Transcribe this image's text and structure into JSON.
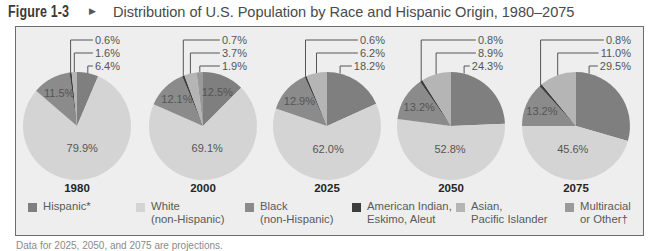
{
  "figure": {
    "number": "Figure 1-3",
    "arrow_icon": "▶",
    "title": "Distribution of U.S. Population by Race and Hispanic Origin, 1980–2075"
  },
  "legend": [
    {
      "key": "hispanic",
      "line1": "Hispanic*",
      "line2": "",
      "color": "#7f7f7f"
    },
    {
      "key": "white",
      "line1": "White",
      "line2": "(non-Hispanic)",
      "color": "#d4d4d4"
    },
    {
      "key": "black",
      "line1": "Black",
      "line2": "(non-Hispanic)",
      "color": "#8b8b8b"
    },
    {
      "key": "american_indian",
      "line1": "American Indian,",
      "line2": "Eskimo, Aleut",
      "color": "#3d3d3d"
    },
    {
      "key": "asian",
      "line1": "Asian,",
      "line2": "Pacific Islander",
      "color": "#b5b5b5"
    },
    {
      "key": "multiracial",
      "line1": "Multiracial",
      "line2": "or Other†",
      "color": "#9a9a9a"
    }
  ],
  "footnote": "Data for 2025, 2050, and 2075 are projections.",
  "chart_data": {
    "type": "pie",
    "title": "Distribution of U.S. Population by Race and Hispanic Origin, 1980–2075",
    "unit": "%",
    "categories": [
      "Hispanic*",
      "White (non-Hispanic)",
      "Black (non-Hispanic)",
      "American Indian, Eskimo, Aleut",
      "Asian, Pacific Islander",
      "Multiracial or Other†"
    ],
    "legend_position": "bottom",
    "layout": {
      "cy": 126,
      "r": 54,
      "label_rows_y": [
        40,
        53,
        66
      ]
    },
    "pies": [
      {
        "year": "1980",
        "cx": 77,
        "label_right_x": 120,
        "slices": [
          {
            "key": "hispanic",
            "value": 6.4,
            "label": "6.4%",
            "placement": "outside",
            "row": 2
          },
          {
            "key": "white",
            "value": 79.9,
            "label": "79.9%",
            "placement": "inside"
          },
          {
            "key": "black",
            "value": 11.5,
            "label": "11.5%",
            "placement": "inside"
          },
          {
            "key": "american_indian",
            "value": 0.6,
            "label": "0.6%",
            "placement": "outside",
            "row": 0
          },
          {
            "key": "asian",
            "value": 1.6,
            "label": "1.6%",
            "placement": "outside",
            "row": 1
          }
        ]
      },
      {
        "year": "2000",
        "cx": 203,
        "label_right_x": 247,
        "slices": [
          {
            "key": "hispanic",
            "value": 12.5,
            "label": "12.5%",
            "placement": "inside"
          },
          {
            "key": "white",
            "value": 69.1,
            "label": "69.1%",
            "placement": "inside"
          },
          {
            "key": "black",
            "value": 12.1,
            "label": "12.1%",
            "placement": "inside"
          },
          {
            "key": "american_indian",
            "value": 0.7,
            "label": "0.7%",
            "placement": "outside",
            "row": 0
          },
          {
            "key": "asian",
            "value": 3.7,
            "label": "3.7%",
            "placement": "outside",
            "row": 1
          },
          {
            "key": "multiracial",
            "value": 1.9,
            "label": "1.9%",
            "placement": "outside",
            "row": 2
          }
        ]
      },
      {
        "year": "2025",
        "cx": 327,
        "label_right_x": 385,
        "slices": [
          {
            "key": "hispanic",
            "value": 18.2,
            "label": "18.2%",
            "placement": "outside",
            "row": 2
          },
          {
            "key": "white",
            "value": 62.0,
            "label": "62.0%",
            "placement": "inside"
          },
          {
            "key": "black",
            "value": 12.9,
            "label": "12.9%",
            "placement": "inside"
          },
          {
            "key": "american_indian",
            "value": 0.6,
            "label": "0.6%",
            "placement": "outside",
            "row": 0
          },
          {
            "key": "asian",
            "value": 6.2,
            "label": "6.2%",
            "placement": "outside",
            "row": 1
          }
        ]
      },
      {
        "year": "2050",
        "cx": 451,
        "label_right_x": 503,
        "slices": [
          {
            "key": "hispanic",
            "value": 24.3,
            "label": "24.3%",
            "placement": "outside",
            "row": 2
          },
          {
            "key": "white",
            "value": 52.8,
            "label": "52.8%",
            "placement": "inside"
          },
          {
            "key": "black",
            "value": 13.2,
            "label": "13.2%",
            "placement": "inside"
          },
          {
            "key": "american_indian",
            "value": 0.8,
            "label": "0.8%",
            "placement": "outside",
            "row": 0
          },
          {
            "key": "asian",
            "value": 8.9,
            "label": "8.9%",
            "placement": "outside",
            "row": 1
          }
        ]
      },
      {
        "year": "2075",
        "cx": 576,
        "label_right_x": 631,
        "slices": [
          {
            "key": "hispanic",
            "value": 29.5,
            "label": "29.5%",
            "placement": "outside",
            "row": 2
          },
          {
            "key": "white",
            "value": 45.6,
            "label": "45.6%",
            "placement": "inside"
          },
          {
            "key": "black",
            "value": 13.2,
            "label": "13.2%",
            "placement": "inside"
          },
          {
            "key": "american_indian",
            "value": 0.8,
            "label": "0.8%",
            "placement": "outside",
            "row": 0
          },
          {
            "key": "asian",
            "value": 11.0,
            "label": "11.0%",
            "placement": "outside",
            "row": 1
          }
        ]
      }
    ]
  }
}
